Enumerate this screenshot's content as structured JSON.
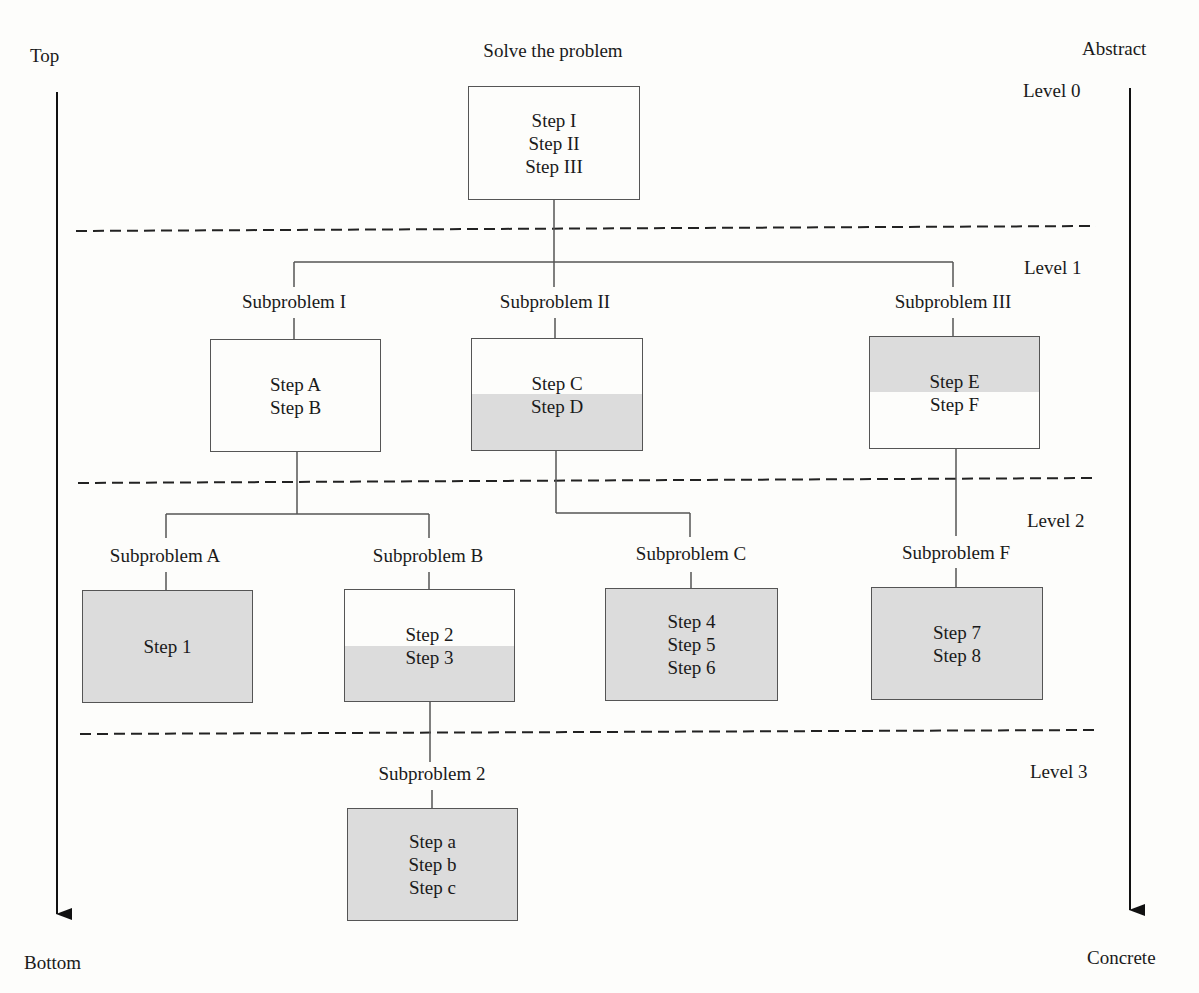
{
  "diagram": {
    "type": "top-down problem decomposition tree",
    "axes": {
      "left": {
        "top_label": "Top",
        "bottom_label": "Bottom"
      },
      "right": {
        "top_label": "Abstract",
        "bottom_label": "Concrete"
      }
    },
    "levels": [
      "Level 0",
      "Level 1",
      "Level 2",
      "Level 3"
    ],
    "root": {
      "title": "Solve the problem",
      "steps": [
        "Step I",
        "Step II",
        "Step III"
      ]
    },
    "level1": [
      {
        "title": "Subproblem I",
        "steps": [
          "Step A",
          "Step B"
        ],
        "shading": "none"
      },
      {
        "title": "Subproblem II",
        "steps": [
          "Step C",
          "Step D"
        ],
        "shading": "bottom (Step D)"
      },
      {
        "title": "Subproblem III",
        "steps": [
          "Step E",
          "Step F"
        ],
        "shading": "top (Step E)"
      }
    ],
    "level2": [
      {
        "title": "Subproblem A",
        "steps": [
          "Step 1"
        ],
        "shading": "full",
        "parent": "Subproblem I"
      },
      {
        "title": "Subproblem B",
        "steps": [
          "Step 2",
          "Step 3"
        ],
        "shading": "bottom (Step 3)",
        "parent": "Subproblem I"
      },
      {
        "title": "Subproblem C",
        "steps": [
          "Step 4",
          "Step 5",
          "Step 6"
        ],
        "shading": "full",
        "parent": "Subproblem II"
      },
      {
        "title": "Subproblem F",
        "steps": [
          "Step 7",
          "Step 8"
        ],
        "shading": "full",
        "parent": "Subproblem III"
      }
    ],
    "level3": [
      {
        "title": "Subproblem 2",
        "steps": [
          "Step a",
          "Step b",
          "Step c"
        ],
        "shading": "full",
        "parent": "Subproblem B"
      }
    ],
    "colors": {
      "shade": "#dcdcdc",
      "line": "#555555",
      "text": "#1a1a1a"
    }
  }
}
